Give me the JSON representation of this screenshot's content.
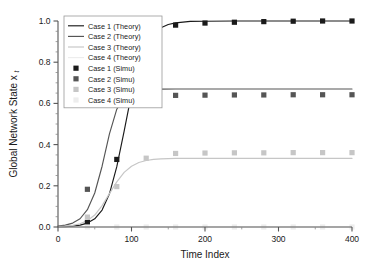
{
  "chart_data": {
    "type": "line",
    "title": "",
    "xlabel": "Time Index",
    "ylabel": "Global Network State x",
    "ylabel_subscript": "t",
    "xlim": [
      0,
      400
    ],
    "ylim": [
      0.0,
      1.0
    ],
    "xticks": [
      0,
      100,
      200,
      300,
      400
    ],
    "xtick_labels": [
      "0",
      "100",
      "200",
      "300",
      "400"
    ],
    "xminor_step": 50,
    "yticks": [
      0.0,
      0.2,
      0.4,
      0.6,
      0.8,
      1.0
    ],
    "ytick_labels": [
      "0.0",
      "0.2",
      "0.4",
      "0.6",
      "0.8",
      "1.0"
    ],
    "yminor_step": 0.05,
    "grid": false,
    "legend_position": "upper-left",
    "colors": {
      "case1": "#1a1a1a",
      "case2": "#555555",
      "case3": "#c6c6c6",
      "case4": "#ededed"
    },
    "marker_x": [
      40,
      80,
      120,
      160,
      200,
      240,
      280,
      320,
      360,
      400
    ],
    "series": [
      {
        "name": "Case 1 (Theory)",
        "kind": "theory",
        "color": "#1a1a1a",
        "plateau": 1.0,
        "midpoint": 92,
        "rate": 0.075,
        "x": [
          0,
          10,
          20,
          30,
          40,
          50,
          60,
          70,
          80,
          90,
          100,
          110,
          120,
          130,
          140,
          150,
          160,
          180,
          200,
          240,
          280,
          320,
          360,
          400
        ],
        "y": [
          0.001,
          0.002,
          0.004,
          0.009,
          0.019,
          0.04,
          0.082,
          0.161,
          0.293,
          0.465,
          0.646,
          0.789,
          0.882,
          0.937,
          0.967,
          0.983,
          0.991,
          0.998,
          0.999,
          1.0,
          1.0,
          1.0,
          1.0,
          1.0
        ]
      },
      {
        "name": "Case 2 (Theory)",
        "kind": "theory",
        "color": "#555555",
        "plateau": 0.67,
        "midpoint": 57,
        "rate": 0.078,
        "x": [
          0,
          10,
          20,
          30,
          40,
          50,
          60,
          70,
          80,
          90,
          100,
          110,
          120,
          140,
          160,
          200,
          240,
          280,
          320,
          360,
          400
        ],
        "y": [
          0.004,
          0.009,
          0.019,
          0.04,
          0.084,
          0.165,
          0.295,
          0.452,
          0.572,
          0.633,
          0.657,
          0.665,
          0.668,
          0.669,
          0.67,
          0.67,
          0.67,
          0.67,
          0.67,
          0.67,
          0.67
        ]
      },
      {
        "name": "Case 3 (Theory)",
        "kind": "theory",
        "color": "#c6c6c6",
        "plateau": 0.333,
        "midpoint": 83,
        "rate": 0.062,
        "x": [
          0,
          10,
          20,
          30,
          40,
          50,
          60,
          70,
          80,
          90,
          100,
          110,
          120,
          130,
          140,
          160,
          180,
          200,
          240,
          280,
          320,
          360,
          400
        ],
        "y": [
          0.002,
          0.004,
          0.008,
          0.016,
          0.031,
          0.058,
          0.104,
          0.162,
          0.219,
          0.265,
          0.295,
          0.313,
          0.323,
          0.328,
          0.331,
          0.333,
          0.333,
          0.333,
          0.333,
          0.333,
          0.333,
          0.333,
          0.333
        ]
      },
      {
        "name": "Case 4 (Theory)",
        "kind": "theory",
        "color": "#ededed",
        "plateau": 0.0,
        "x": [
          0,
          50,
          100,
          150,
          200,
          250,
          300,
          350,
          400
        ],
        "y": [
          0.0,
          0.0,
          0.0,
          0.0,
          0.0,
          0.0,
          0.0,
          0.0,
          0.0
        ]
      },
      {
        "name": "Case 1 (Simu)",
        "kind": "simulation",
        "color": "#1a1a1a",
        "x": [
          40,
          80,
          120,
          160,
          200,
          240,
          280,
          320,
          360,
          400
        ],
        "y": [
          0.022,
          0.328,
          0.925,
          0.98,
          0.99,
          0.994,
          0.997,
          0.999,
          1.0,
          1.0
        ]
      },
      {
        "name": "Case 2 (Simu)",
        "kind": "simulation",
        "color": "#555555",
        "x": [
          40,
          80,
          120,
          160,
          200,
          240,
          280,
          320,
          360,
          400
        ],
        "y": [
          0.183,
          0.593,
          0.634,
          0.639,
          0.64,
          0.641,
          0.641,
          0.642,
          0.642,
          0.642
        ]
      },
      {
        "name": "Case 3 (Simu)",
        "kind": "simulation",
        "color": "#c6c6c6",
        "x": [
          40,
          80,
          120,
          160,
          200,
          240,
          280,
          320,
          360,
          400
        ],
        "y": [
          0.048,
          0.196,
          0.334,
          0.357,
          0.359,
          0.36,
          0.36,
          0.361,
          0.361,
          0.361
        ]
      },
      {
        "name": "Case 4 (Simu)",
        "kind": "simulation",
        "color": "#ededed",
        "x": [
          40,
          80,
          120,
          160,
          200,
          240,
          280,
          320,
          360,
          400
        ],
        "y": [
          0.0,
          0.0,
          0.0,
          0.0,
          0.0,
          0.0,
          0.0,
          0.0,
          0.0,
          0.0
        ]
      }
    ],
    "legend": [
      {
        "label": "Case 1 (Theory)",
        "marker": "line",
        "color": "#1a1a1a"
      },
      {
        "label": "Case 2 (Theory)",
        "marker": "line",
        "color": "#555555"
      },
      {
        "label": "Case 3 (Theory)",
        "marker": "line",
        "color": "#c6c6c6"
      },
      {
        "label": "Case 4 (Theory)",
        "marker": "line",
        "color": "#ededed"
      },
      {
        "label": "Case 1 (Simu)",
        "marker": "square",
        "color": "#1a1a1a"
      },
      {
        "label": "Case 2 (Simu)",
        "marker": "square",
        "color": "#555555"
      },
      {
        "label": "Case 3 (Simu)",
        "marker": "square",
        "color": "#c6c6c6"
      },
      {
        "label": "Case 4 (Simu)",
        "marker": "square",
        "color": "#ededed"
      }
    ]
  }
}
